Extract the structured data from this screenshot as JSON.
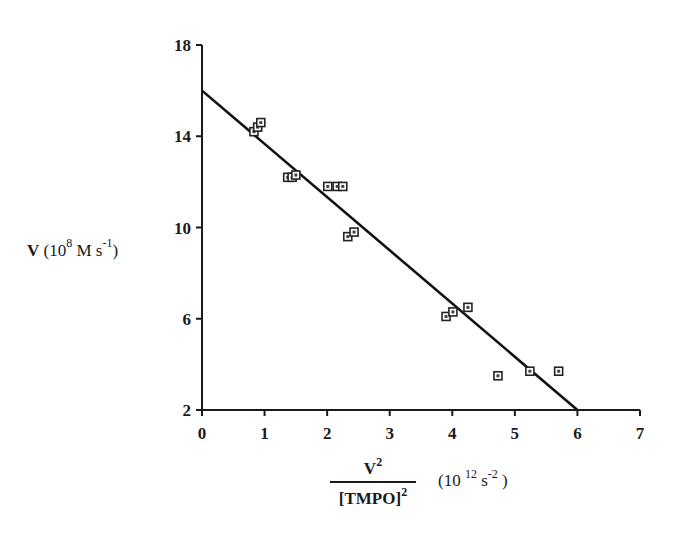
{
  "chart_data": {
    "type": "scatter",
    "title": "",
    "xlabel": "V^2 / [TMPO]^2 (10^12 s^-2)",
    "ylabel": "V (10^8 M s^-1)",
    "xlim": [
      0,
      7
    ],
    "ylim": [
      2,
      18
    ],
    "x_ticks": [
      "0",
      "1",
      "2",
      "3",
      "4",
      "5",
      "6",
      "7"
    ],
    "y_ticks": [
      "2",
      "6",
      "10",
      "14",
      "18"
    ],
    "grid": false,
    "legend": null,
    "series": [
      {
        "name": "data",
        "marker": "square",
        "points": [
          {
            "x": 0.83,
            "y": 14.2
          },
          {
            "x": 0.89,
            "y": 14.4
          },
          {
            "x": 0.94,
            "y": 14.6
          },
          {
            "x": 1.37,
            "y": 12.2
          },
          {
            "x": 1.44,
            "y": 12.2
          },
          {
            "x": 1.5,
            "y": 12.3
          },
          {
            "x": 2.01,
            "y": 11.8
          },
          {
            "x": 2.16,
            "y": 11.8
          },
          {
            "x": 2.25,
            "y": 11.8
          },
          {
            "x": 2.33,
            "y": 9.6
          },
          {
            "x": 2.43,
            "y": 9.8
          },
          {
            "x": 3.9,
            "y": 6.1
          },
          {
            "x": 4.01,
            "y": 6.3
          },
          {
            "x": 4.25,
            "y": 6.5
          },
          {
            "x": 4.73,
            "y": 3.5
          },
          {
            "x": 5.24,
            "y": 3.7
          },
          {
            "x": 5.7,
            "y": 3.7
          }
        ]
      }
    ],
    "fit_line": {
      "name": "linear fit",
      "x": [
        0,
        6
      ],
      "y": [
        16,
        2
      ]
    }
  },
  "labels": {
    "y_main": "V",
    "y_units_open": " (10",
    "y_units_exp": "8",
    "y_units_mid": " M s",
    "y_units_exp2": "-1",
    "y_units_close": ")",
    "x_num": "V",
    "x_num_exp": "2",
    "x_den": "[TMPO]",
    "x_den_exp": "2",
    "x_units_open": "(10 ",
    "x_units_exp": "12",
    "x_units_mid": " s",
    "x_units_exp2": "-2",
    "x_units_close": " )"
  }
}
